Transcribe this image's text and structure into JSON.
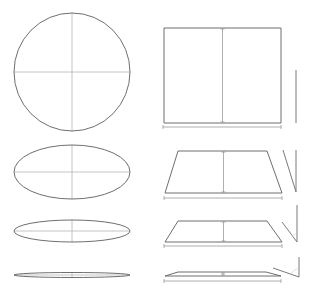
{
  "diagram": {
    "colors": {
      "background": "#ffffff",
      "outline": "#6e6e6e",
      "axis": "#b5b5b5",
      "dimension": "#9a9a9a"
    },
    "circles": [
      {
        "cx": 72,
        "cy": 72,
        "rx": 58,
        "ry": 59
      },
      {
        "cx": 72,
        "cy": 172,
        "rx": 58,
        "ry": 27
      },
      {
        "cx": 72,
        "cy": 231,
        "rx": 58,
        "ry": 11
      },
      {
        "cx": 72,
        "cy": 275,
        "rx": 58,
        "ry": 2.5
      }
    ],
    "planes": [
      {
        "top_y": 28,
        "bottom_y": 123,
        "top_left": 164,
        "top_right": 281,
        "bottom_left": 164,
        "bottom_right": 281,
        "dim_y": 127
      },
      {
        "top_y": 151,
        "bottom_y": 193,
        "top_left": 178,
        "top_right": 267,
        "bottom_left": 165,
        "bottom_right": 282,
        "dim_y": 198
      },
      {
        "top_y": 221,
        "bottom_y": 242,
        "top_left": 178,
        "top_right": 267,
        "bottom_left": 165,
        "bottom_right": 282,
        "dim_y": 246
      },
      {
        "top_y": 272,
        "bottom_y": 276,
        "top_left": 178,
        "top_right": 266,
        "bottom_left": 165,
        "bottom_right": 281,
        "dim_y": 281
      }
    ],
    "angle_markers": [
      {
        "vx": 296,
        "vy1": 70,
        "vy2": 123,
        "sx": 296,
        "sy": 70
      },
      {
        "vx": 296,
        "vy1": 150,
        "vy2": 192,
        "sx": 283,
        "sy": 150
      },
      {
        "vx": 297,
        "vy1": 205,
        "vy2": 242,
        "sx": 282,
        "sy": 222
      },
      {
        "vx": 299,
        "vy1": 257,
        "vy2": 277,
        "sx": 273,
        "sy": 268
      }
    ]
  }
}
